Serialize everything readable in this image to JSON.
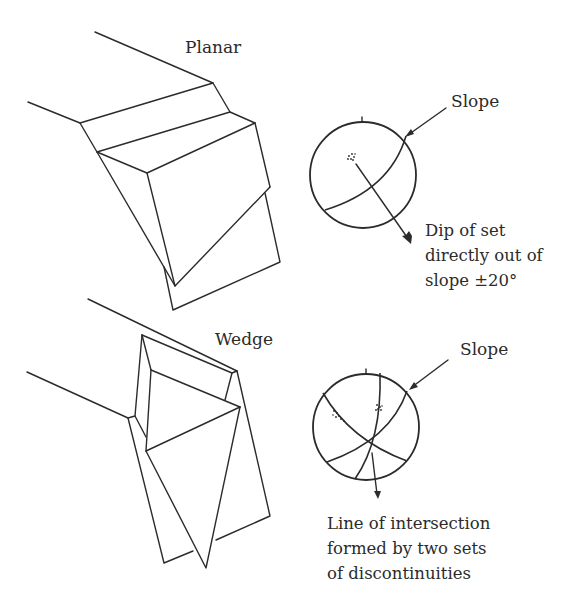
{
  "figure": {
    "panels": [
      {
        "id": "planar",
        "title": "Planar",
        "stereonet": {
          "slope_label": "Slope",
          "caption_lines": [
            "Dip of set",
            "directly out of",
            "slope ±20°"
          ]
        }
      },
      {
        "id": "wedge",
        "title": "Wedge",
        "stereonet": {
          "slope_label": "Slope",
          "caption_lines": [
            "Line of intersection",
            "formed by two sets",
            "of discontinuities"
          ]
        }
      }
    ],
    "colors": {
      "line": "#2b2b2b",
      "background": "#ffffff"
    }
  }
}
